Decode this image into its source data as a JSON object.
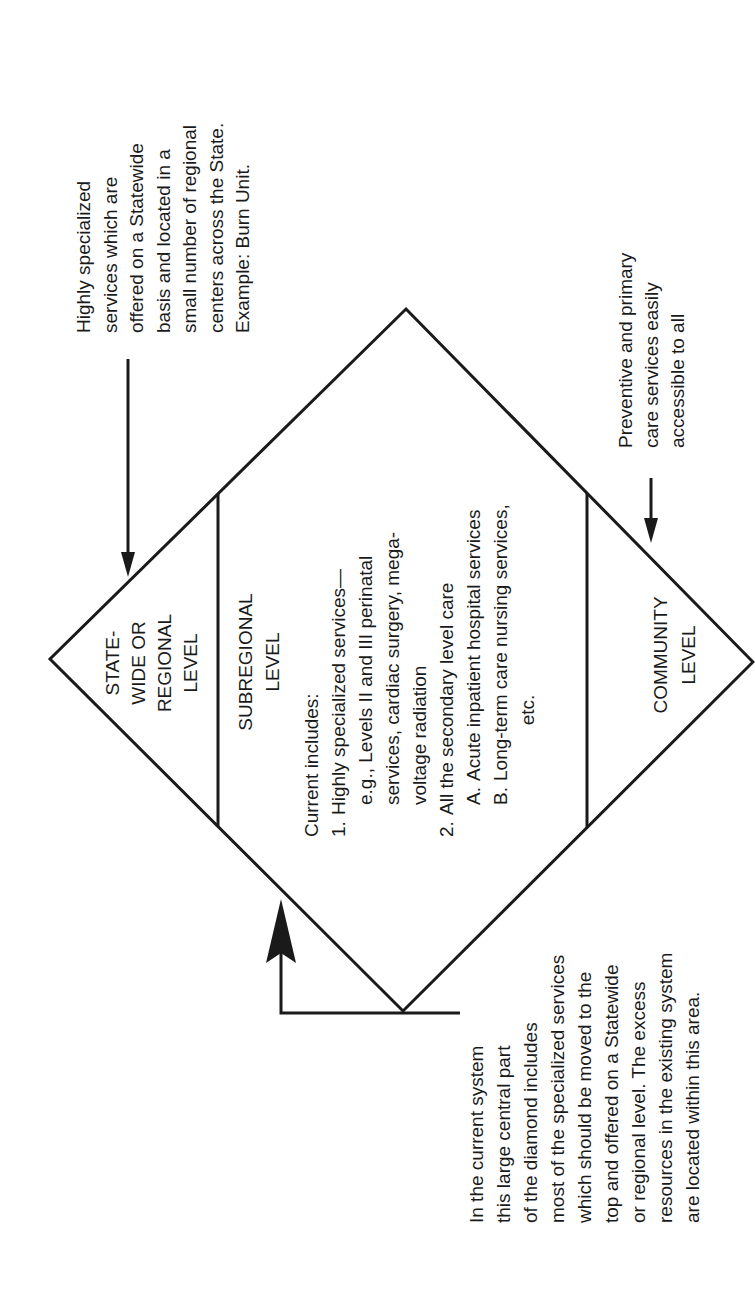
{
  "diagram": {
    "shape": "diamond",
    "levels": {
      "top": {
        "label_lines": [
          "STATE-",
          "WIDE OR",
          "REGIONAL",
          "LEVEL"
        ]
      },
      "middle": {
        "label_lines": [
          "SUBREGIONAL",
          "LEVEL"
        ],
        "body": {
          "intro": "Current includes:",
          "items": [
            {
              "num": "1.",
              "lines": [
                "Highly specialized services—",
                "e.g., Levels II and III perinatal",
                "services, cardiac surgery, mega-",
                "voltage radiation"
              ]
            },
            {
              "num": "2.",
              "lines": [
                "All the secondary level care"
              ]
            }
          ],
          "subitems": [
            {
              "letter": "A.",
              "text": "Acute inpatient hospital services"
            },
            {
              "letter": "B.",
              "text": "Long-term care nursing services,"
            }
          ],
          "trailing": "etc."
        }
      },
      "bottom": {
        "label_lines": [
          "COMMUNITY",
          "LEVEL"
        ]
      }
    },
    "annotations": {
      "top": {
        "lines": [
          "Highly specialized",
          "services which are",
          "offered on a Statewide",
          "basis and located in a",
          "small number of regional",
          "centers across the State.",
          "Example: Burn Unit."
        ]
      },
      "bottom": {
        "lines": [
          "Preventive and primary",
          "care services easily",
          "accessible to all"
        ]
      },
      "middle": {
        "lines": [
          "In the current system",
          "this large central part",
          "of the diamond includes",
          "most of the specialized services",
          "which should be moved to the",
          "top and offered on a Statewide",
          "or regional level. The excess",
          "resources in the existing system",
          "are located within this area."
        ]
      }
    },
    "colors": {
      "ink": "#1a1a1a",
      "background": "#ffffff"
    }
  }
}
